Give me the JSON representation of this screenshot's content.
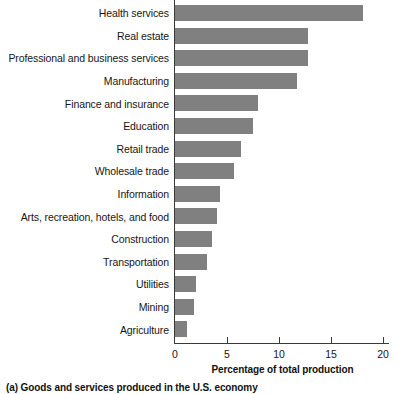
{
  "chart_data": {
    "type": "bar",
    "orientation": "horizontal",
    "title": "",
    "xlabel": "Percentage of total production",
    "ylabel": "",
    "xlim": [
      0,
      21
    ],
    "xticks": [
      0,
      5,
      10,
      15,
      20
    ],
    "xtick_labels": [
      "0",
      "5",
      "10",
      "15",
      "20"
    ],
    "grid": false,
    "legend": null,
    "bar_color": "#808080",
    "axis_color": "#3a3a3a",
    "categories": [
      "Health services",
      "Real estate",
      "Professional and business services",
      "Manufacturing",
      "Finance and insurance",
      "Education",
      "Retail trade",
      "Wholesale trade",
      "Information",
      "Arts, recreation, hotels, and food",
      "Construction",
      "Transportation",
      "Utilities",
      "Mining",
      "Agriculture"
    ],
    "values": [
      18.1,
      12.8,
      12.8,
      11.7,
      8.0,
      7.5,
      6.3,
      5.7,
      4.3,
      4.0,
      3.6,
      3.1,
      2.0,
      1.8,
      1.2
    ]
  },
  "caption": {
    "text": "(a) Goods and services produced in the U.S. economy"
  }
}
